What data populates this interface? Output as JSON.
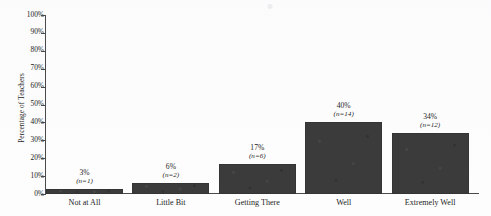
{
  "chart_data": {
    "type": "bar",
    "title": "",
    "xlabel": "",
    "ylabel": "Percentage of Teachers",
    "categories": [
      "Not at All",
      "Little Bit",
      "Getting There",
      "Well",
      "Extremely Well"
    ],
    "values": [
      3,
      6,
      17,
      40,
      34
    ],
    "counts": [
      1,
      2,
      6,
      14,
      12
    ],
    "value_labels": [
      "3%",
      "6%",
      "17%",
      "40%",
      "34%"
    ],
    "count_labels": [
      "(n=1)",
      "(n=2)",
      "(n=6)",
      "(n=14)",
      "(n=12)"
    ],
    "ylim": [
      0,
      100
    ],
    "ytick_values": [
      100,
      90,
      80,
      70,
      60,
      50,
      40,
      30,
      20,
      10,
      0
    ],
    "ytick_labels": [
      "100%",
      "90%",
      "80%",
      "70%",
      "60%",
      "50%",
      "40%",
      "30%",
      "20%",
      "10%",
      "0%"
    ],
    "grid": false,
    "legend": false,
    "bar_color": "#3b3b3b",
    "axis_color": "#4a4a4a",
    "background_color": "#fdfdfd"
  }
}
